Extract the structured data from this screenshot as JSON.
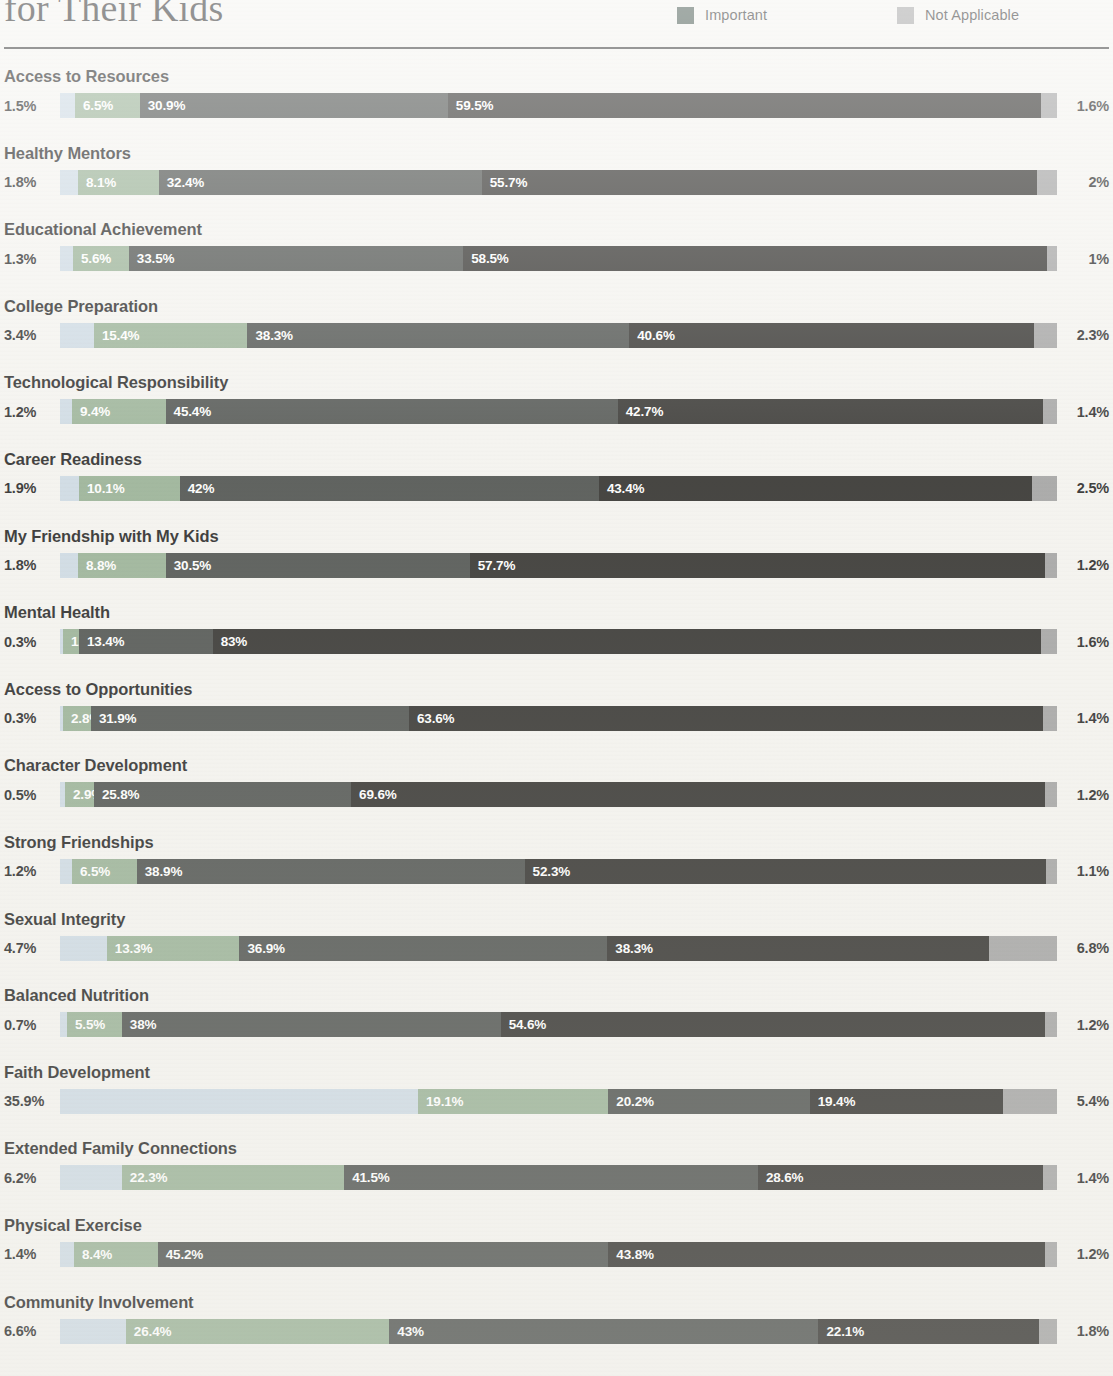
{
  "header": {
    "title": "for Their Kids",
    "legend": [
      {
        "label": "Not Important",
        "color": "#c9d7e2"
      },
      {
        "label": "Slightly Important",
        "color": "#8faa8c"
      },
      {
        "label": "Mildly Important",
        "color": "#8faa8c"
      },
      {
        "label": "Important",
        "color": "#2f4038"
      },
      {
        "label": "Not Applicable",
        "color": "#9a9a9a"
      }
    ],
    "legend_visible": [
      {
        "label": "Important",
        "color": "#35483f",
        "col": 1
      },
      {
        "label": "Not Applicable",
        "color": "#9a9a9a",
        "col": 2
      }
    ]
  },
  "chart_data": {
    "type": "bar",
    "subtype": "100% stacked horizontal bar",
    "title": "for Their Kids",
    "xlabel": "",
    "ylabel": "",
    "xlim": [
      0,
      100
    ],
    "grid": false,
    "legend_position": "top-right",
    "series": [
      {
        "name": "Not Important",
        "color": "#c9d7e2"
      },
      {
        "name": "Slightly Important",
        "color": "#8faa8c"
      },
      {
        "name": "Mildly Important",
        "color": "#3b3f3c"
      },
      {
        "name": "Important",
        "color": "#1b1a17"
      },
      {
        "name": "Not Applicable",
        "color": "#9a9a9a"
      }
    ],
    "categories": [
      "Access to Resources",
      "Healthy Mentors",
      "Educational Achievement",
      "College Preparation",
      "Technological Responsibility",
      "Career Readiness",
      "My Friendship with My Kids",
      "Mental Health",
      "Access to Opportunities",
      "Character Development",
      "Strong Friendships",
      "Sexual Integrity",
      "Balanced Nutrition",
      "Faith Development",
      "Extended Family Connections",
      "Physical Exercise",
      "Community Involvement"
    ],
    "values": [
      [
        1.5,
        6.5,
        30.9,
        59.5,
        1.6
      ],
      [
        1.8,
        8.1,
        32.4,
        55.7,
        2.0
      ],
      [
        1.3,
        5.6,
        33.5,
        58.5,
        1.0
      ],
      [
        3.4,
        15.4,
        38.3,
        40.6,
        2.3
      ],
      [
        1.2,
        9.4,
        45.4,
        42.7,
        1.4
      ],
      [
        1.9,
        10.1,
        42.0,
        43.4,
        2.5
      ],
      [
        1.8,
        8.8,
        30.5,
        57.7,
        1.2
      ],
      [
        0.3,
        1.6,
        13.4,
        83.0,
        1.6
      ],
      [
        0.3,
        2.8,
        31.9,
        63.6,
        1.4
      ],
      [
        0.5,
        2.9,
        25.8,
        69.6,
        1.2
      ],
      [
        1.2,
        6.5,
        38.9,
        52.3,
        1.1
      ],
      [
        4.7,
        13.3,
        36.9,
        38.3,
        6.8
      ],
      [
        0.7,
        5.5,
        38.0,
        54.6,
        1.2
      ],
      [
        35.9,
        19.1,
        20.2,
        19.4,
        5.4
      ],
      [
        6.2,
        22.3,
        41.5,
        28.6,
        1.4
      ],
      [
        1.4,
        8.4,
        45.2,
        43.8,
        1.2
      ],
      [
        6.6,
        26.4,
        43.0,
        22.1,
        1.8
      ]
    ],
    "labels": [
      [
        "1.5%",
        "6.5%",
        "30.9%",
        "59.5%",
        "1.6%"
      ],
      [
        "1.8%",
        "8.1%",
        "32.4%",
        "55.7%",
        "2%"
      ],
      [
        "1.3%",
        "5.6%",
        "33.5%",
        "58.5%",
        "1%"
      ],
      [
        "3.4%",
        "15.4%",
        "38.3%",
        "40.6%",
        "2.3%"
      ],
      [
        "1.2%",
        "9.4%",
        "45.4%",
        "42.7%",
        "1.4%"
      ],
      [
        "1.9%",
        "10.1%",
        "42%",
        "43.4%",
        "2.5%"
      ],
      [
        "1.8%",
        "8.8%",
        "30.5%",
        "57.7%",
        "1.2%"
      ],
      [
        "0.3%",
        "1.6%",
        "13.4%",
        "83%",
        "1.6%"
      ],
      [
        "0.3%",
        "2.8%",
        "31.9%",
        "63.6%",
        "1.4%"
      ],
      [
        "0.5%",
        "2.9%",
        "25.8%",
        "69.6%",
        "1.2%"
      ],
      [
        "1.2%",
        "6.5%",
        "38.9%",
        "52.3%",
        "1.1%"
      ],
      [
        "4.7%",
        "13.3%",
        "36.9%",
        "38.3%",
        "6.8%"
      ],
      [
        "0.7%",
        "5.5%",
        "38%",
        "54.6%",
        "1.2%"
      ],
      [
        "35.9%",
        "19.1%",
        "20.2%",
        "19.4%",
        "5.4%"
      ],
      [
        "6.2%",
        "22.3%",
        "41.5%",
        "28.6%",
        "1.4%"
      ],
      [
        "1.4%",
        "8.4%",
        "45.2%",
        "43.8%",
        "1.2%"
      ],
      [
        "6.6%",
        "26.4%",
        "43%",
        "22.1%",
        "1.8%"
      ]
    ]
  }
}
